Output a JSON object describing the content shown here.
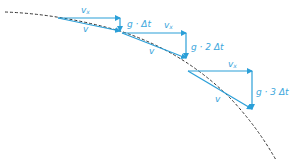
{
  "diagram": {
    "colors": {
      "arrow": "#2a9fd8",
      "curve": "#333333",
      "label": "#3aa6dc"
    },
    "steps": [
      {
        "vx_label": "v",
        "vx_sub": "x",
        "v_label": "v",
        "g_label": "g · Δt"
      },
      {
        "vx_label": "v",
        "vx_sub": "x",
        "v_label": "v",
        "g_label": "g · 2 Δt"
      },
      {
        "vx_label": "v",
        "vx_sub": "x",
        "v_label": "v",
        "g_label": "g · 3 Δt"
      }
    ]
  }
}
